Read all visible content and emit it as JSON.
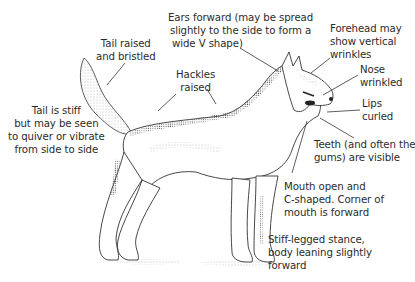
{
  "figure": {
    "colors": {
      "ink": "#2b2b2b",
      "line": "#333333",
      "fur": "#555555",
      "background": "#ffffff"
    }
  },
  "annotations": {
    "top_cut": {
      "lines": [
        "... (cut off at top edge)"
      ]
    },
    "ears": {
      "lines": [
        "Ears forward (may be spread",
        "slightly to the side to form a",
        "wide V shape)"
      ]
    },
    "forehead": {
      "lines": [
        "Forehead may",
        "show vertical",
        "wrinkles"
      ]
    },
    "tail_raised": {
      "lines": [
        "Tail raised",
        "and bristled"
      ]
    },
    "hackles": {
      "lines": [
        "Hackles",
        "raised"
      ]
    },
    "nose": {
      "lines": [
        "Nose",
        "wrinkled"
      ]
    },
    "lips": {
      "lines": [
        "Lips",
        "curled"
      ]
    },
    "tail_stiff": {
      "lines": [
        "Tail is stiff",
        "but may be seen",
        "to quiver or vibrate",
        "from side to side"
      ]
    },
    "teeth": {
      "lines": [
        "Teeth (and often the",
        "gums) are visible"
      ]
    },
    "mouth": {
      "lines": [
        "Mouth open and",
        "C-shaped. Corner of",
        "mouth is forward"
      ]
    },
    "stance": {
      "lines": [
        "Stiff-legged stance,",
        "body leaning slightly",
        "forward"
      ]
    }
  }
}
